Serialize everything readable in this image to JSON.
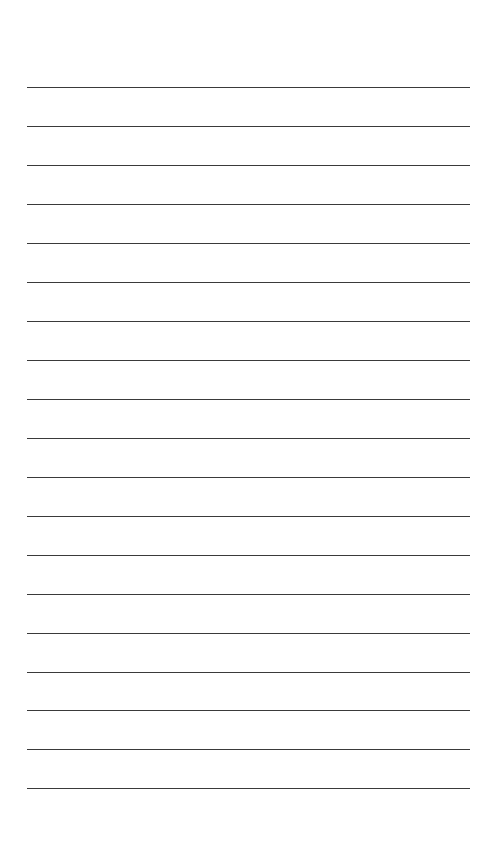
{
  "page": {
    "type": "lined-paper",
    "line_count": 19,
    "first_line_y": 88,
    "line_spacing": 38.95,
    "line_left": 27,
    "line_right": 470,
    "line_color": "#3a3a3a",
    "background_color": "#ffffff"
  }
}
